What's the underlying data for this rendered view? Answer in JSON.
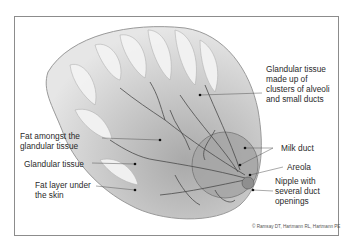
{
  "diagram": {
    "labels": [
      {
        "id": "glandular-tissue-clusters",
        "text": "Glandular tissue\nmade up of\nclusters of alveoli\nand small ducts"
      },
      {
        "id": "fat-amongst-glandular",
        "text": "Fat amongst the\nglandular tissue"
      },
      {
        "id": "glandular-tissue",
        "text": "Glandular tissue"
      },
      {
        "id": "fat-layer-under-skin",
        "text": "Fat layer under\nthe skin"
      },
      {
        "id": "milk-duct",
        "text": "Milk duct"
      },
      {
        "id": "areola",
        "text": "Areola"
      },
      {
        "id": "nipple",
        "text": "Nipple with\nseveral duct\nopenings"
      }
    ],
    "credit": "© Ramsay DT, Hartmann RL, Hartmann PE",
    "colors": {
      "frame": "#8c8c8c",
      "tissue": "#bdbdbd",
      "duct": "#4a4a4a",
      "text": "#2a2a2a"
    }
  }
}
